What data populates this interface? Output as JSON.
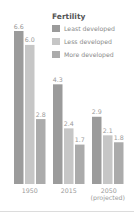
{
  "chart_data": {
    "type": "bar",
    "title": "Fertility",
    "categories": [
      "1950",
      "2015",
      "2050\n(projected)"
    ],
    "category_lines": [
      [
        "1950"
      ],
      [
        "2015"
      ],
      [
        "2050",
        "(projected)"
      ]
    ],
    "series": [
      {
        "name": "Least developed",
        "values": [
          6.6,
          4.3,
          2.9
        ],
        "labels": [
          "6.6",
          "4.3",
          "2.9"
        ],
        "color": "#9b9b9b"
      },
      {
        "name": "Less developed",
        "values": [
          6.0,
          2.4,
          2.1
        ],
        "labels": [
          "6.0",
          "2.4",
          "2.1"
        ],
        "color": "#c6c6c6"
      },
      {
        "name": "More developed",
        "values": [
          2.8,
          1.7,
          1.8
        ],
        "labels": [
          "2.8",
          "1.7",
          "1.8"
        ],
        "color": "#ababab"
      }
    ],
    "ylim": [
      0,
      6.6
    ],
    "xlabel": "",
    "ylabel": "",
    "grid": false,
    "legend_position": "top-right"
  },
  "legend": {
    "title": "Fertility"
  }
}
